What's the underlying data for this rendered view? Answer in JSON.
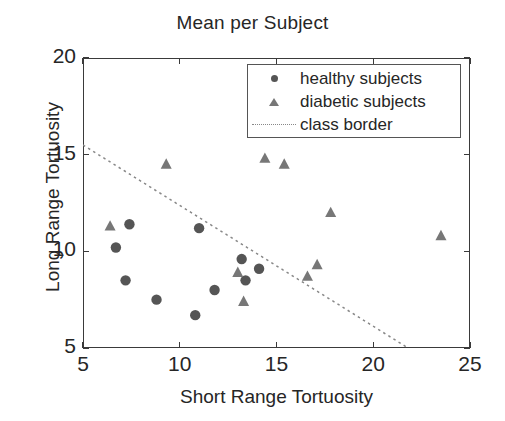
{
  "chart_data": {
    "type": "scatter",
    "title": "Mean per Subject",
    "xlabel": "Short Range Tortuosity",
    "ylabel": "Long Range Tortuosity",
    "xlim": [
      5,
      25
    ],
    "ylim": [
      5,
      20
    ],
    "xticks": [
      5,
      10,
      15,
      20,
      25
    ],
    "yticks": [
      5,
      10,
      15,
      20
    ],
    "xtick_labels": [
      "5",
      "10",
      "15",
      "20",
      "25"
    ],
    "ytick_labels": [
      "5",
      "10",
      "15",
      "20"
    ],
    "grid": false,
    "legend_position": "top-right",
    "series": [
      {
        "name": "healthy subjects",
        "marker": "circle",
        "color": "#555555",
        "points": [
          {
            "x": 7.4,
            "y": 11.4
          },
          {
            "x": 6.7,
            "y": 10.2
          },
          {
            "x": 7.2,
            "y": 8.5
          },
          {
            "x": 8.8,
            "y": 7.5
          },
          {
            "x": 10.8,
            "y": 6.7
          },
          {
            "x": 11.0,
            "y": 11.2
          },
          {
            "x": 11.8,
            "y": 8.0
          },
          {
            "x": 13.2,
            "y": 9.6
          },
          {
            "x": 13.4,
            "y": 8.5
          },
          {
            "x": 14.1,
            "y": 9.1
          }
        ]
      },
      {
        "name": "diabetic subjects",
        "marker": "triangle",
        "color": "#777777",
        "points": [
          {
            "x": 6.4,
            "y": 11.3
          },
          {
            "x": 9.3,
            "y": 14.5
          },
          {
            "x": 13.0,
            "y": 8.9
          },
          {
            "x": 13.3,
            "y": 7.4
          },
          {
            "x": 14.4,
            "y": 14.8
          },
          {
            "x": 15.4,
            "y": 14.5
          },
          {
            "x": 16.6,
            "y": 8.7
          },
          {
            "x": 17.1,
            "y": 9.3
          },
          {
            "x": 17.8,
            "y": 12.0
          },
          {
            "x": 23.5,
            "y": 10.8
          }
        ]
      }
    ],
    "annotations": [
      {
        "name": "class border",
        "type": "line",
        "style": "dotted",
        "color": "#888888",
        "x0": 5.0,
        "y0": 15.5,
        "x1": 21.8,
        "y1": 5.0
      }
    ],
    "legend_entries": [
      {
        "label": "healthy subjects",
        "marker": "circle"
      },
      {
        "label": "diabetic subjects",
        "marker": "triangle"
      },
      {
        "label": "class border",
        "marker": "dotted-line"
      }
    ]
  }
}
